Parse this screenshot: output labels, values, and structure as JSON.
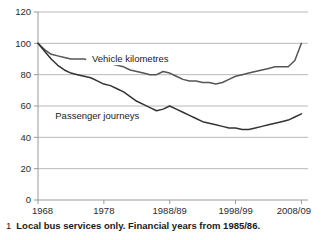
{
  "footnote": {
    "marker": "1",
    "text": "Local bus services only. Financial years from 1985/86."
  },
  "chart_data": {
    "type": "line",
    "title": "",
    "subtitle": "",
    "xlabel": "",
    "ylabel": "",
    "grid": true,
    "legend_position": "inline-labels",
    "ylim": [
      0,
      120
    ],
    "yticks": [
      0,
      20,
      40,
      60,
      80,
      100,
      120
    ],
    "ytick_labels": [
      "0",
      "20",
      "40",
      "60",
      "80",
      "100",
      "120"
    ],
    "xlim": [
      1968,
      2009
    ],
    "xticks": [
      1968,
      1978,
      1988,
      1998,
      2008
    ],
    "xtick_labels": [
      "1968",
      "1978",
      "1988/89",
      "1998/99",
      "2008/09"
    ],
    "x": [
      1968,
      1969,
      1970,
      1971,
      1972,
      1973,
      1974,
      1975,
      1976,
      1977,
      1978,
      1979,
      1980,
      1981,
      1982,
      1983,
      1984,
      1985,
      1986,
      1987,
      1988,
      1989,
      1990,
      1991,
      1992,
      1993,
      1994,
      1995,
      1996,
      1997,
      1998,
      1999,
      2000,
      2001,
      2002,
      2003,
      2004,
      2005,
      2006,
      2007,
      2008
    ],
    "series": [
      {
        "name": "Vehicle kilometres",
        "color": "#555555",
        "label_x": 1982,
        "label_y": 88,
        "values": [
          100,
          96,
          93,
          92,
          91,
          90,
          90,
          90,
          89,
          88,
          87,
          87,
          86,
          85,
          83,
          82,
          81,
          80,
          80,
          82,
          81,
          79,
          77,
          76,
          76,
          75,
          75,
          74,
          75,
          77,
          79,
          80,
          81,
          82,
          83,
          84,
          85,
          85,
          85,
          89,
          100
        ]
      },
      {
        "name": "Passenger journeys",
        "color": "#333333",
        "label_x": 1977,
        "label_y": 52,
        "values": [
          100,
          95,
          90,
          86,
          83,
          81,
          80,
          79,
          78,
          76,
          74,
          73,
          71,
          69,
          66,
          63,
          61,
          59,
          57,
          58,
          60,
          58,
          56,
          54,
          52,
          50,
          49,
          48,
          47,
          46,
          46,
          45,
          45,
          46,
          47,
          48,
          49,
          50,
          51,
          53,
          55
        ]
      }
    ]
  }
}
